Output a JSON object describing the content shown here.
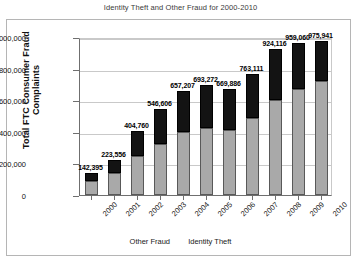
{
  "chart_data": {
    "type": "bar",
    "title": "Identity Theft and Other Fraud for 2000-2010",
    "xlabel": "",
    "ylabel": "Total FTC Consumer Fraud Complaints",
    "ylim": [
      0,
      1000000
    ],
    "yticks": [
      "0",
      "200,000",
      "400,000",
      "600,000",
      "800,000",
      "1,000,000"
    ],
    "ytick_values": [
      0,
      200000,
      400000,
      600000,
      800000,
      1000000
    ],
    "grid": true,
    "stacked": true,
    "legend_position": "bottom",
    "categories": [
      "2000",
      "2001",
      "2002",
      "2003",
      "2004",
      "2005",
      "2006",
      "2007",
      "2008",
      "2009",
      "2010"
    ],
    "series": [
      {
        "name": "Other Fraud",
        "color": "#a9a9a9",
        "values": [
          86000,
          138000,
          245000,
          325000,
          400000,
          425000,
          410000,
          490000,
          600000,
          670000,
          720000
        ]
      },
      {
        "name": "Identity Theft",
        "color": "#131313",
        "values": [
          56395,
          85556,
          159760,
          221606,
          257207,
          268272,
          259886,
          273111,
          324116,
          289060,
          255941
        ]
      }
    ],
    "totals": [
      142395,
      223556,
      404760,
      546606,
      657207,
      693272,
      669886,
      763111,
      924116,
      959060,
      975941
    ],
    "data_labels": [
      "142,395",
      "223,556",
      "404,760",
      "546,606",
      "657,207",
      "693,272",
      "669,886",
      "763,111",
      "924,116",
      "959,060",
      "975,941"
    ],
    "legend": [
      {
        "label": "Other Fraud"
      },
      {
        "label": "Identity Theft"
      }
    ]
  }
}
